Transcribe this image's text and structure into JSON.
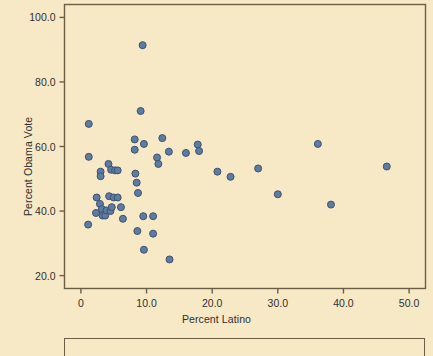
{
  "figure": {
    "background_color": "#f7e8c6",
    "frame_color": "#6b5f48",
    "marker_fill": "#5e7ba0",
    "marker_edge": "#3d5273",
    "text_color": "#2f2f2f"
  },
  "chart_data": {
    "type": "scatter",
    "title": "",
    "xlabel": "Percent Latino",
    "ylabel": "Percent Obama Vote",
    "xlim": [
      -2.5,
      52.5
    ],
    "ylim": [
      16.0,
      104.0
    ],
    "xticks": [
      0,
      10,
      20,
      30,
      40,
      50
    ],
    "xtick_labels": [
      "0",
      "10.0",
      "20.0",
      "30.0",
      "40.0",
      "50.0"
    ],
    "yticks": [
      20,
      40,
      60,
      80,
      100
    ],
    "ytick_labels": [
      "20.0",
      "40.0",
      "60.0",
      "80.0",
      "100.0"
    ],
    "grid": false,
    "legend": null,
    "series": [
      {
        "name": "states",
        "marker": "circle",
        "color": "#5e7ba0",
        "points": [
          [
            1.2,
            67.0
          ],
          [
            1.2,
            56.8
          ],
          [
            1.1,
            35.8
          ],
          [
            2.4,
            44.2
          ],
          [
            2.3,
            39.4
          ],
          [
            3.0,
            52.2
          ],
          [
            3.0,
            50.8
          ],
          [
            2.9,
            42.2
          ],
          [
            3.2,
            40.6
          ],
          [
            3.3,
            38.6
          ],
          [
            3.7,
            38.6
          ],
          [
            4.2,
            54.6
          ],
          [
            4.3,
            44.6
          ],
          [
            3.9,
            40.2
          ],
          [
            4.5,
            40.0
          ],
          [
            4.6,
            52.8
          ],
          [
            4.7,
            41.2
          ],
          [
            5.0,
            44.2
          ],
          [
            5.2,
            52.6
          ],
          [
            5.6,
            52.6
          ],
          [
            5.6,
            44.2
          ],
          [
            6.1,
            41.2
          ],
          [
            6.4,
            37.6
          ],
          [
            8.2,
            62.2
          ],
          [
            8.2,
            59.0
          ],
          [
            8.3,
            51.6
          ],
          [
            8.5,
            48.8
          ],
          [
            8.7,
            45.6
          ],
          [
            8.6,
            33.8
          ],
          [
            9.1,
            71.0
          ],
          [
            9.4,
            91.4
          ],
          [
            9.6,
            60.8
          ],
          [
            9.5,
            38.4
          ],
          [
            9.6,
            28.0
          ],
          [
            11.0,
            38.4
          ],
          [
            11.0,
            33.0
          ],
          [
            11.6,
            56.6
          ],
          [
            11.8,
            54.6
          ],
          [
            12.4,
            62.6
          ],
          [
            13.4,
            58.4
          ],
          [
            13.5,
            25.0
          ],
          [
            16.0,
            58.0
          ],
          [
            17.8,
            60.6
          ],
          [
            18.0,
            58.6
          ],
          [
            20.8,
            52.2
          ],
          [
            22.8,
            50.6
          ],
          [
            27.0,
            53.2
          ],
          [
            30.0,
            45.2
          ],
          [
            36.1,
            60.8
          ],
          [
            38.1,
            42.0
          ],
          [
            46.6,
            53.8
          ]
        ]
      }
    ]
  }
}
